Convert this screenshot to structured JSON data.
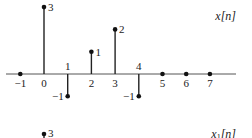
{
  "chart_data": [
    {
      "type": "stem",
      "title": "x[n]",
      "x": [
        -1,
        0,
        1,
        2,
        3,
        4,
        5,
        6,
        7
      ],
      "values": [
        0,
        3,
        -1,
        1,
        2,
        -1,
        0,
        0,
        0
      ],
      "n_labels": [
        "−1",
        "0",
        "1",
        "2",
        "3",
        "4",
        "5",
        "6",
        "7"
      ],
      "value_labels": {
        "0": "3",
        "1": "−1",
        "2": "1",
        "3": "2",
        "4": "−1"
      },
      "xlabel": "n",
      "ylabel": ""
    },
    {
      "type": "stem",
      "title": "x1[n]",
      "x": [
        0
      ],
      "values": [
        3
      ],
      "value_labels": {
        "0": "3"
      },
      "note": "partially visible (cropped)"
    }
  ],
  "plot1": {
    "title_main": "x",
    "title_arg": "[n]"
  },
  "plot2": {
    "title_main": "x",
    "title_sub": "1",
    "title_arg": "[n]",
    "value_label": "3"
  }
}
